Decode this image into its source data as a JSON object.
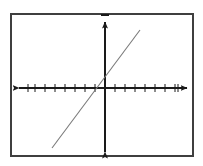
{
  "figure": {
    "kind": "coordinate-plane-with-line",
    "title": "",
    "background_color": "#ffffff",
    "frame": {
      "border_color": "#3f3f3f",
      "border_width": 2,
      "x": 10,
      "y": 13,
      "width": 184,
      "height": 144
    },
    "axis_color": "#1a1a1a",
    "axis_width": 2,
    "tick_color": "#1a1a1a",
    "tick_width": 1,
    "line_color": "#7a7a7a",
    "line_width": 1
  },
  "chart_data": {
    "type": "line",
    "title": "",
    "xlabel": "",
    "ylabel": "",
    "grid": false,
    "legend": "none",
    "origin_px": {
      "x": 105,
      "y": 88
    },
    "tick_spacing_px": 10,
    "xlim": [
      -8,
      8
    ],
    "ylim": [
      -7,
      7
    ],
    "x_axis": {
      "start_px": 19,
      "end_px": 187,
      "arrow_both_ends": true,
      "tick_count_left": 8,
      "tick_count_right": 8,
      "tick_values": [
        -8,
        -7,
        -6,
        -5,
        -4,
        -3,
        -2,
        -1,
        1,
        2,
        3,
        4,
        5,
        6,
        7,
        8
      ],
      "tick_labels": []
    },
    "y_axis": {
      "start_px": 22,
      "end_px": 152,
      "arrow_both_ends": true,
      "tick_count_above": 6,
      "tick_count_below": 6,
      "tick_values": [
        -6,
        -5,
        -4,
        -3,
        -2,
        -1,
        1,
        2,
        3,
        4,
        5,
        6
      ],
      "tick_labels": []
    },
    "series": [
      {
        "name": "line",
        "kind": "straight-line",
        "slope": 1.33,
        "y_intercept": 0.5,
        "color": "#7a7a7a",
        "endpoints_px": [
          {
            "x": 52,
            "y": 148
          },
          {
            "x": 140,
            "y": 30
          }
        ],
        "endpoints_data": [
          {
            "x": -5.3,
            "y": -6.0
          },
          {
            "x": 3.5,
            "y": 5.8
          }
        ]
      }
    ]
  }
}
